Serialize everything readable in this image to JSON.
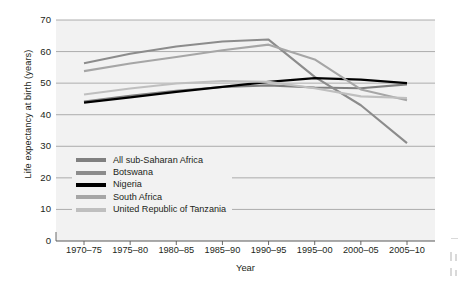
{
  "chart_data": {
    "type": "line",
    "title": "",
    "xlabel": "Year",
    "ylabel": "Life expectancy at birth (years)",
    "categories": [
      "1970–75",
      "1975–80",
      "1980–85",
      "1985–90",
      "1990–95",
      "1995–00",
      "2000–05",
      "2005–10"
    ],
    "ylim": [
      0,
      70
    ],
    "yticks": [
      0,
      10,
      20,
      30,
      40,
      50,
      60,
      70
    ],
    "grid": true,
    "legend_position": "inside-lower-left",
    "series": [
      {
        "name": "All sub-Saharan Africa",
        "color": "#808080",
        "values": [
          44.2,
          46.0,
          47.6,
          48.8,
          49.3,
          48.6,
          48.4,
          49.6
        ]
      },
      {
        "name": "Botswana",
        "color": "#8c8c8c",
        "values": [
          56.3,
          59.3,
          61.6,
          63.2,
          63.8,
          52.0,
          43.0,
          31.0
        ]
      },
      {
        "name": "Nigeria",
        "color": "#000000",
        "values": [
          43.8,
          45.5,
          47.2,
          48.8,
          50.4,
          51.6,
          51.1,
          50.0
        ]
      },
      {
        "name": "South Africa",
        "color": "#a6a6a6",
        "values": [
          53.8,
          56.2,
          58.3,
          60.4,
          62.2,
          57.5,
          48.0,
          44.6
        ]
      },
      {
        "name": "United Republic of Tanzania",
        "color": "#bfbfbf",
        "values": [
          46.4,
          48.3,
          49.9,
          50.7,
          50.4,
          48.4,
          45.8,
          45.3
        ]
      }
    ]
  },
  "plot": {
    "background_color": "#f2f2f2",
    "gridline_color": "#9a9a9a",
    "axis_color": "#595959"
  }
}
